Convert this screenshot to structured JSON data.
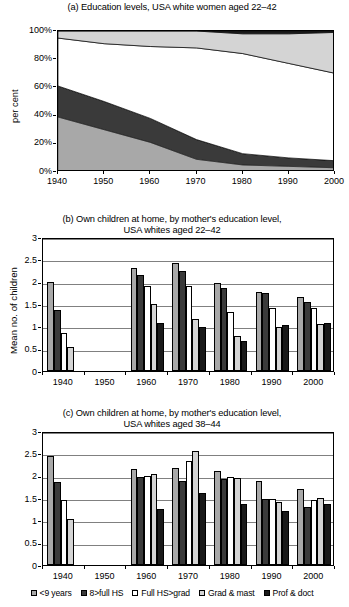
{
  "series_colors": {
    "lt9": "#a8a8a8",
    "full_hs": "#3a3a3a",
    "hs_grad": "#ffffff",
    "grad_mast": "#d4d4d4",
    "prof_doct": "#1a1a1a"
  },
  "legend": {
    "items": [
      {
        "label": "<9 years",
        "icon": "square-swatch",
        "color": "#a8a8a8"
      },
      {
        "label": "8>full HS",
        "icon": "square-swatch",
        "color": "#3a3a3a"
      },
      {
        "label": "Full HS>grad",
        "icon": "square-swatch",
        "color": "#ffffff"
      },
      {
        "label": "Grad & mast",
        "icon": "square-swatch",
        "color": "#d4d4d4"
      },
      {
        "label": "Prof & doct",
        "icon": "square-swatch",
        "color": "#1a1a1a"
      }
    ]
  },
  "chart_data": [
    {
      "type": "area",
      "panel": "a",
      "title": "(a) Education levels, USA white women aged 22–42",
      "xlabel": "",
      "ylabel": "per cent",
      "stacked": true,
      "normalized_percent": true,
      "grid": false,
      "x": [
        1940,
        1950,
        1960,
        1970,
        1980,
        1990,
        2000
      ],
      "xlim": [
        1940,
        2000
      ],
      "ylim": [
        0,
        100
      ],
      "ytick_labels": [
        "0%",
        "20%",
        "40%",
        "60%",
        "80%",
        "100%"
      ],
      "ytick_values": [
        0,
        20,
        40,
        60,
        80,
        100
      ],
      "xtick_labels": [
        "1940",
        "1950",
        "1960",
        "1970",
        "1980",
        "1990",
        "2000"
      ],
      "series": [
        {
          "name": "<9 years",
          "color": "#a8a8a8",
          "values": [
            39,
            30,
            21,
            9,
            5,
            4,
            3
          ]
        },
        {
          "name": "8>full HS",
          "color": "#3a3a3a",
          "values": [
            22,
            20,
            17,
            14,
            8,
            6,
            5
          ]
        },
        {
          "name": "Full HS>grad",
          "color": "#ffffff",
          "values": [
            34,
            41,
            51,
            65,
            71,
            67,
            62
          ]
        },
        {
          "name": "Grad & mast",
          "color": "#d4d4d4",
          "values": [
            5,
            9,
            11,
            12,
            14,
            21,
            29
          ]
        },
        {
          "name": "Prof & doct",
          "color": "#1a1a1a",
          "values": [
            0,
            0,
            0,
            0,
            2,
            2,
            1
          ]
        }
      ]
    },
    {
      "type": "bar",
      "panel": "b",
      "title_line1": "(b) Own children at home, by mother's education level,",
      "title_line2": "USA whites aged 22–42",
      "xlabel": "",
      "ylabel": "Mean no. of children",
      "grid": true,
      "categories": [
        "1940",
        "1950",
        "1960",
        "1970",
        "1980",
        "1990",
        "2000"
      ],
      "ylim": [
        0,
        3
      ],
      "ytick_labels": [
        "0",
        "0.5",
        "1",
        "1.5",
        "2",
        "2.5",
        "3"
      ],
      "ytick_values": [
        0,
        0.5,
        1,
        1.5,
        2,
        2.5,
        3
      ],
      "series": [
        {
          "name": "<9 years",
          "color": "#a8a8a8",
          "values": [
            2.0,
            null,
            2.3,
            2.41,
            1.98,
            1.77,
            1.66
          ]
        },
        {
          "name": "8>full HS",
          "color": "#3a3a3a",
          "values": [
            1.36,
            null,
            2.16,
            2.25,
            1.86,
            1.74,
            1.55
          ]
        },
        {
          "name": "Full HS>grad",
          "color": "#ffffff",
          "values": [
            0.84,
            null,
            1.91,
            1.91,
            1.33,
            1.41,
            1.41
          ]
        },
        {
          "name": "Grad & mast",
          "color": "#d4d4d4",
          "values": [
            0.54,
            null,
            1.5,
            1.16,
            0.79,
            0.99,
            1.06
          ]
        },
        {
          "name": "Prof & doct",
          "color": "#1a1a1a",
          "values": [
            null,
            null,
            1.08,
            0.98,
            0.68,
            1.04,
            1.08
          ]
        }
      ]
    },
    {
      "type": "bar",
      "panel": "c",
      "title_line1": "(c) Own children at home, by mother's education level,",
      "title_line2": "USA whites aged 38–44",
      "xlabel": "",
      "ylabel": "",
      "grid": true,
      "categories": [
        "1940",
        "1950",
        "1960",
        "1970",
        "1980",
        "1990",
        "2000"
      ],
      "ylim": [
        0,
        3
      ],
      "ytick_labels": [
        "0",
        "0.5",
        "1",
        "1.5",
        "2",
        "2.5",
        "3"
      ],
      "ytick_values": [
        0,
        0.5,
        1,
        1.5,
        2,
        2.5,
        3
      ],
      "series": [
        {
          "name": "<9 years",
          "color": "#a8a8a8",
          "values": [
            2.44,
            null,
            2.16,
            2.18,
            2.11,
            1.89,
            1.71
          ]
        },
        {
          "name": "8>full HS",
          "color": "#3a3a3a",
          "values": [
            1.85,
            null,
            1.96,
            1.89,
            1.93,
            1.48,
            1.31
          ]
        },
        {
          "name": "Full HS>grad",
          "color": "#ffffff",
          "values": [
            1.45,
            null,
            1.99,
            2.33,
            1.96,
            1.48,
            1.45
          ]
        },
        {
          "name": "Grad & mast",
          "color": "#d4d4d4",
          "values": [
            1.02,
            null,
            2.03,
            2.56,
            1.94,
            1.41,
            1.51
          ]
        },
        {
          "name": "Prof & doct",
          "color": "#1a1a1a",
          "values": [
            null,
            null,
            1.25,
            1.61,
            1.37,
            1.2,
            1.37
          ]
        }
      ]
    }
  ]
}
